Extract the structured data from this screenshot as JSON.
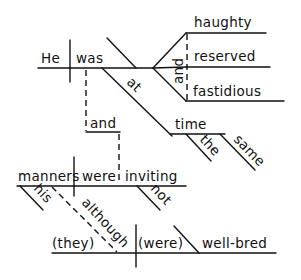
{
  "diagram": {
    "type": "sentence-diagram",
    "style": "Reed-Kellogg",
    "words": {
      "subject_1": "He",
      "verb_1": "was",
      "pred_adj_1": "haughty",
      "pred_adj_2": "reserved",
      "pred_adj_3": "fastidious",
      "conj_adj": "and",
      "prep": "at",
      "prep_obj": "time",
      "mod_the": "the",
      "mod_same": "same",
      "conj_clause": "and",
      "subject_2": "manners",
      "mod_his": "his",
      "verb_2": "were",
      "participle": "inviting",
      "mod_not": "not",
      "sub_conj": "although",
      "subject_3": "(they)",
      "verb_3": "(were)",
      "pred_adj_4": "well-bred"
    },
    "ink_color": "#111111",
    "background": "#ffffff"
  }
}
